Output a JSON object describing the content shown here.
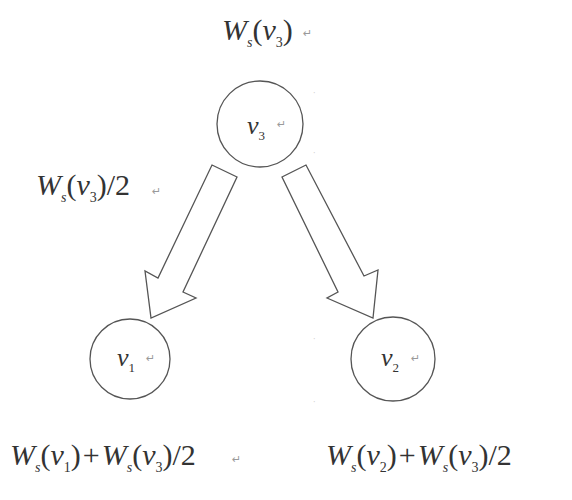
{
  "diagram": {
    "type": "weight-split-tree",
    "top_label": {
      "W": "W",
      "sub": "s",
      "arg": "v",
      "argsub": "3",
      "mark": "↵"
    },
    "edge_label": {
      "W": "W",
      "sub": "s",
      "arg": "v",
      "argsub": "3",
      "suffix": "/2",
      "mark": "↵"
    },
    "nodes": [
      {
        "id": "v3",
        "label": "v",
        "sub": "3",
        "mark": "↵"
      },
      {
        "id": "v1",
        "label": "v",
        "sub": "1",
        "mark": "↵"
      },
      {
        "id": "v2",
        "label": "v",
        "sub": "2",
        "mark": "↵"
      }
    ],
    "bottom_left_label": {
      "t1": {
        "W": "W",
        "sub": "s",
        "arg": "v",
        "argsub": "1"
      },
      "op": "+",
      "t2": {
        "W": "W",
        "sub": "s",
        "arg": "v",
        "argsub": "3"
      },
      "suffix": "/2",
      "mark": "↵"
    },
    "bottom_right_label": {
      "t1": {
        "W": "W",
        "sub": "s",
        "arg": "v",
        "argsub": "2"
      },
      "op": "+",
      "t2": {
        "W": "W",
        "sub": "s",
        "arg": "v",
        "argsub": "3"
      },
      "suffix": "/2"
    },
    "edges": [
      {
        "from": "v3",
        "to": "v1"
      },
      {
        "from": "v3",
        "to": "v2"
      }
    ],
    "colors": {
      "stroke": "#555555",
      "text": "#333333",
      "background": "#ffffff"
    }
  }
}
